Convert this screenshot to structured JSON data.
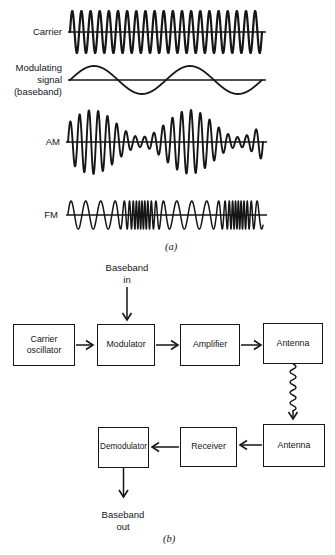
{
  "colors": {
    "ink": "#161616",
    "background": "#ffffff"
  },
  "panel_a": {
    "label": "(a)",
    "waveforms": [
      {
        "name": "carrier",
        "label_lines": [
          "Carrier"
        ],
        "type": "sine",
        "cycles": 21,
        "amplitude": 21,
        "baseline_y": 32,
        "x_start": 70,
        "x_end": 262,
        "stroke_width": 2.2
      },
      {
        "name": "modulating-signal",
        "label_lines": [
          "Modulating",
          "signal",
          "(baseband)"
        ],
        "type": "sine",
        "cycles": 2,
        "amplitude": 14,
        "baseline_y": 80,
        "x_start": 70,
        "x_end": 262,
        "stroke_width": 1.8
      },
      {
        "name": "am",
        "label_lines": [
          "AM"
        ],
        "type": "am",
        "carrier_cycles": 21,
        "envelope_cycles": 2,
        "modulation_index": 0.73,
        "amplitude_max": 32,
        "baseline_y": 142,
        "x_start": 68,
        "x_end": 263,
        "stroke_width": 1.9
      },
      {
        "name": "fm",
        "label_lines": [
          "FM"
        ],
        "type": "fm",
        "base_cycles": 13,
        "extra_cycles": 58,
        "sharpness": 4,
        "envelope_cycles": 2,
        "amplitude": 14,
        "baseline_y": 215,
        "x_start": 68,
        "x_end": 263,
        "stroke_width": 1.5
      }
    ]
  },
  "panel_b": {
    "label": "(b)",
    "baseband_in_lines": [
      "Baseband",
      "in"
    ],
    "baseband_out_lines": [
      "Baseband",
      "out"
    ],
    "blocks": [
      {
        "name": "carrier-oscillator",
        "label_lines": [
          "Carrier",
          "oscillator"
        ]
      },
      {
        "name": "modulator",
        "label_lines": [
          "Modulator"
        ]
      },
      {
        "name": "amplifier",
        "label_lines": [
          "Amplifier"
        ]
      },
      {
        "name": "antenna-tx",
        "label_lines": [
          "Antenna"
        ]
      },
      {
        "name": "demodulator",
        "label_lines": [
          "Demodulator"
        ]
      },
      {
        "name": "receiver",
        "label_lines": [
          "Receiver"
        ]
      },
      {
        "name": "antenna-rx",
        "label_lines": [
          "Antenna"
        ]
      }
    ]
  }
}
